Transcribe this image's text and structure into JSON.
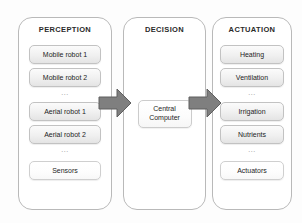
{
  "diagram": {
    "type": "block-flow",
    "panels": [
      {
        "id": "perception",
        "title": "PERCEPTION",
        "items": [
          {
            "label": "Mobile robot 1",
            "style": "shaded"
          },
          {
            "label": "Mobile robot 2",
            "style": "shaded"
          },
          {
            "label": "...",
            "style": "ellipsis"
          },
          {
            "label": "Aerial robot 1",
            "style": "shaded"
          },
          {
            "label": "Aerial robot 2",
            "style": "shaded"
          },
          {
            "label": "...",
            "style": "ellipsis"
          },
          {
            "label": "Sensors",
            "style": "plain"
          }
        ]
      },
      {
        "id": "decision",
        "title": "DECISION",
        "center_box": {
          "line1": "Central",
          "line2": "Computer"
        }
      },
      {
        "id": "actuation",
        "title": "ACTUATION",
        "items": [
          {
            "label": "Heating",
            "style": "shaded"
          },
          {
            "label": "Ventilation",
            "style": "shaded"
          },
          {
            "label": "...",
            "style": "ellipsis"
          },
          {
            "label": "Irrigation",
            "style": "shaded"
          },
          {
            "label": "Nutrients",
            "style": "shaded"
          },
          {
            "label": "...",
            "style": "ellipsis"
          },
          {
            "label": "Actuators",
            "style": "plain"
          }
        ]
      }
    ],
    "arrows": [
      {
        "id": "perception-to-decision",
        "direction": "right"
      },
      {
        "id": "decision-to-actuation",
        "direction": "right"
      }
    ],
    "colors": {
      "panel_border": "#b9b9b9",
      "box_border": "#c2c2c2",
      "box_fill": "#f0f0f0",
      "arrow_fill": "#7f7f7f",
      "arrow_border": "#5f5f5f",
      "text": "#1d1d1d",
      "background": "#ffffff"
    }
  }
}
